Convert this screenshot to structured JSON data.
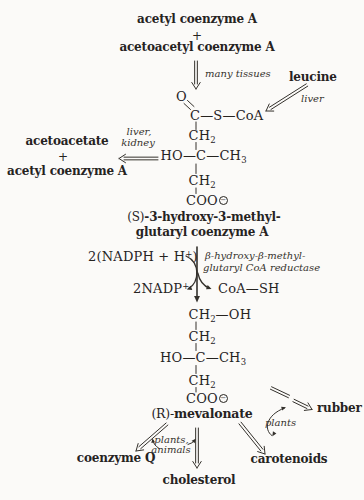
{
  "colors": {
    "background": "#fbfaf8",
    "text": "#26231f",
    "arrow": "#34312c"
  },
  "top": {
    "substrate1": "acetyl coenzyme A",
    "plus": "+",
    "substrate2": "acetoacetyl coenzyme A",
    "arrow_label": "many tissues"
  },
  "leucine": {
    "name": "leucine",
    "arrow_label": "liver"
  },
  "hmg_coa": {
    "o": "O",
    "thioester": "C—S—CoA",
    "ch2_top_base": "CH",
    "ch2_top_sub": "2",
    "carbinol_pre": "HO—C—CH",
    "carbinol_sub": "3",
    "ch2_bottom_base": "CH",
    "ch2_bottom_sub": "2",
    "carboxylate": "COO",
    "charge": "−",
    "name_prefix": "(S)",
    "name_rest": "-3-hydroxy-3-methyl-",
    "name_line2": "glutaryl coenzyme A"
  },
  "shunt": {
    "arrow_label_1": "liver,",
    "arrow_label_2": "kidney",
    "product1": "acetoacetate",
    "plus": "+",
    "product2": "acetyl coenzyme A"
  },
  "reduction": {
    "in_pre": "2(NADPH + H",
    "in_sup": "+",
    "in_post": ")",
    "out_base": "2NADP",
    "out_sup": "+",
    "byproduct": "CoA—SH",
    "enzyme_1": "β-hydroxy-β-methyl-",
    "enzyme_2": "glutaryl CoA reductase"
  },
  "mevalonate": {
    "ch2oh_base": "CH",
    "ch2oh_sub": "2",
    "ch2oh_tail": "—OH",
    "ch2_base": "CH",
    "ch2_sub": "2",
    "carbinol_pre": "HO—C—CH",
    "carbinol_sub": "3",
    "ch2b_base": "CH",
    "ch2b_sub": "2",
    "carboxylate": "COO",
    "charge": "−",
    "name_prefix": "(R)-",
    "name_rest": "mevalonate"
  },
  "products": {
    "coenzyme_q": "coenzyme Q",
    "cholesterol": "cholesterol",
    "carotenoids": "carotenoids",
    "rubber": "rubber",
    "plants_animals_1": "plants,",
    "plants_animals_2": "animals",
    "plants": "plants"
  }
}
